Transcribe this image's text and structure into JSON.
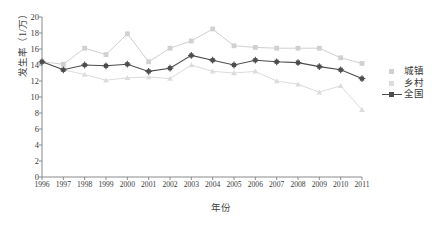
{
  "chart_data": {
    "type": "line",
    "title": "",
    "xlabel": "年份",
    "ylabel": "发生率（1/万）",
    "categories": [
      "1996",
      "1997",
      "1998",
      "1999",
      "2000",
      "2001",
      "2002",
      "2003",
      "2004",
      "2005",
      "2006",
      "2007",
      "2008",
      "2009",
      "2010",
      "2011"
    ],
    "x": [
      1996,
      1997,
      1998,
      1999,
      2000,
      2001,
      2002,
      2003,
      2004,
      2005,
      2006,
      2007,
      2008,
      2009,
      2010,
      2011
    ],
    "ylim": [
      0,
      20
    ],
    "xlim": [
      1996,
      2011
    ],
    "ytick_step": 2,
    "yticks": [
      0,
      2,
      4,
      6,
      8,
      10,
      12,
      14,
      16,
      18,
      20
    ],
    "grid": false,
    "legend_position": "right",
    "series": [
      {
        "name": "城镇",
        "color": "#d0d0d0",
        "marker": "square",
        "values": [
          14.4,
          14.1,
          16.1,
          15.3,
          17.9,
          14.4,
          16.1,
          17.0,
          18.5,
          16.4,
          16.2,
          16.1,
          16.1,
          16.1,
          14.9,
          14.2
        ]
      },
      {
        "name": "乡村",
        "color": "#dcdcdc",
        "marker": "triangle",
        "values": [
          14.4,
          13.4,
          12.8,
          12.1,
          12.4,
          12.5,
          12.3,
          14.0,
          13.2,
          13.0,
          13.2,
          12.0,
          11.6,
          10.6,
          11.4,
          8.4
        ]
      },
      {
        "name": "全国",
        "color": "#4d4d4d",
        "marker": "star",
        "values": [
          14.4,
          13.4,
          14.0,
          13.9,
          14.1,
          13.2,
          13.6,
          15.2,
          14.6,
          14.0,
          14.6,
          14.4,
          14.3,
          13.8,
          13.4,
          12.3
        ]
      }
    ]
  },
  "legend": {
    "items": [
      {
        "label": "城镇"
      },
      {
        "label": "乡村"
      },
      {
        "label": "全国"
      }
    ]
  }
}
